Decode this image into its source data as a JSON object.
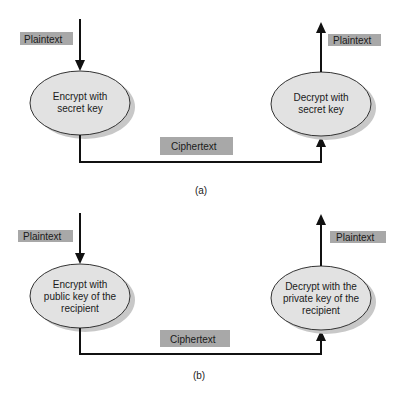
{
  "figure": {
    "panels": [
      {
        "id": "a",
        "caption": "(a)",
        "input_label": "Plaintext",
        "encrypt_node": {
          "lines": [
            "Encrypt with",
            "secret key"
          ]
        },
        "transfer_label": "Ciphertext",
        "decrypt_node": {
          "lines": [
            "Decrypt with",
            "secret key"
          ]
        },
        "output_label": "Plaintext"
      },
      {
        "id": "b",
        "caption": "(b)",
        "input_label": "Plaintext",
        "encrypt_node": {
          "lines": [
            "Encrypt with",
            "public key of the",
            "recipient"
          ]
        },
        "transfer_label": "Ciphertext",
        "decrypt_node": {
          "lines": [
            "Decrypt with the",
            "private key of the",
            "recipient"
          ]
        },
        "output_label": "Plaintext"
      }
    ],
    "colors": {
      "label_fill": "#a8a8a8",
      "ellipse_fill": "#e2e2e2",
      "ellipse_shadow": "#c8c8c8",
      "line": "#111111"
    }
  }
}
